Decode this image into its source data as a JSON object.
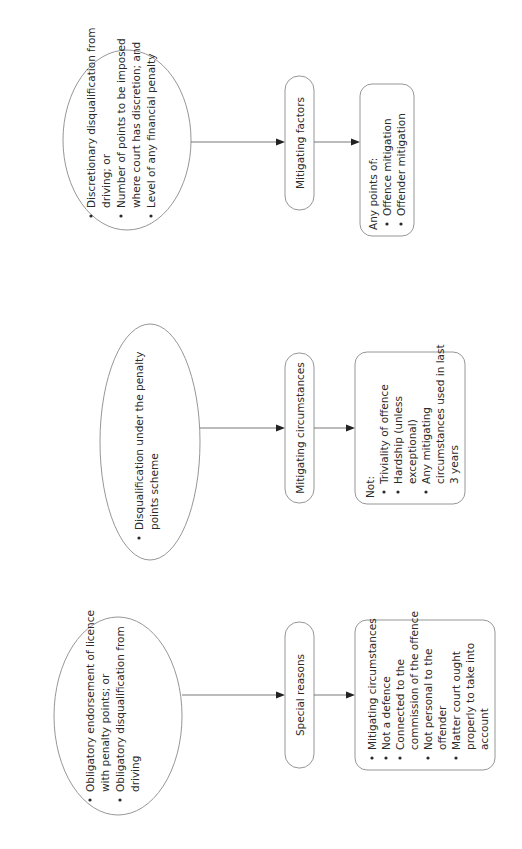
{
  "diagram": {
    "orientation": "rotated-90-ccw",
    "columns": [
      {
        "id": "special-reasons",
        "ellipse": {
          "bullets": [
            [
              "Obligatory endorsement of licence",
              "with penalty points; or"
            ],
            [
              "Obligatory disqualification from",
              "driving"
            ]
          ]
        },
        "pill": {
          "label": "Special reasons"
        },
        "box": {
          "heading": "",
          "bullets": [
            [
              "Mitigating circumstances"
            ],
            [
              "Not a defence"
            ],
            [
              "Connected to the",
              "commission of the offence"
            ],
            [
              "Not personal to the",
              "offender"
            ],
            [
              "Matter court ought",
              "properly to take into",
              "account"
            ]
          ]
        }
      },
      {
        "id": "mitigating-circumstances",
        "ellipse": {
          "bullets": [
            [
              "Disqualification under the penalty",
              "points scheme"
            ]
          ]
        },
        "pill": {
          "label": "Mitigating circumstances"
        },
        "box": {
          "heading": "Not:",
          "bullets": [
            [
              "Triviality of offence"
            ],
            [
              "Hardship (unless",
              "exceptional)"
            ],
            [
              "Any mitigating",
              "circumstances used in last",
              "3 years"
            ]
          ]
        }
      },
      {
        "id": "mitigating-factors",
        "ellipse": {
          "bullets": [
            [
              "Discretionary disqualification from",
              "driving; or"
            ],
            [
              "Number of points to be imposed",
              "where court has discretion; and"
            ],
            [
              "Level of any financial penalty"
            ]
          ]
        },
        "pill": {
          "label": "Mitigating factors"
        },
        "box": {
          "heading": "Any points of:",
          "bullets": [
            [
              "Offence mitigation"
            ],
            [
              "Offender mitigation"
            ]
          ]
        }
      }
    ]
  }
}
